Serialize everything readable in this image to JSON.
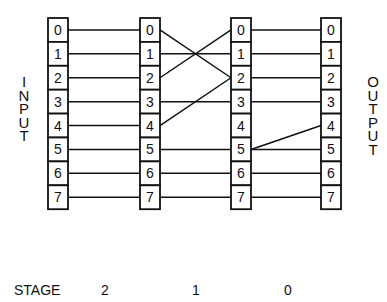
{
  "left_label": "INPUT",
  "right_label": "OUTPUT",
  "stage_title": "STAGE",
  "stages": [
    "2",
    "1",
    "0"
  ],
  "columns": [
    {
      "cells": [
        "0",
        "1",
        "2",
        "3",
        "4",
        "5",
        "6",
        "7"
      ]
    },
    {
      "cells": [
        "0",
        "1",
        "2",
        "3",
        "4",
        "5",
        "6",
        "7"
      ]
    },
    {
      "cells": [
        "0",
        "1",
        "2",
        "3",
        "4",
        "5",
        "6",
        "7"
      ]
    },
    {
      "cells": [
        "0",
        "1",
        "2",
        "3",
        "4",
        "5",
        "6",
        "7"
      ]
    }
  ],
  "connections": [
    {
      "stage": "2",
      "links": [
        [
          0,
          0
        ],
        [
          1,
          1
        ],
        [
          2,
          2
        ],
        [
          3,
          3
        ],
        [
          4,
          4
        ],
        [
          5,
          5
        ],
        [
          6,
          6
        ],
        [
          7,
          7
        ]
      ]
    },
    {
      "stage": "1",
      "links": [
        [
          0,
          2
        ],
        [
          1,
          1
        ],
        [
          2,
          0
        ],
        [
          3,
          3
        ],
        [
          4,
          2
        ],
        [
          5,
          5
        ],
        [
          6,
          6
        ],
        [
          7,
          7
        ]
      ]
    },
    {
      "stage": "0",
      "links": [
        [
          0,
          0
        ],
        [
          1,
          1
        ],
        [
          2,
          2
        ],
        [
          3,
          3
        ],
        [
          5,
          4
        ],
        [
          5,
          5
        ],
        [
          6,
          6
        ],
        [
          7,
          7
        ]
      ]
    }
  ]
}
